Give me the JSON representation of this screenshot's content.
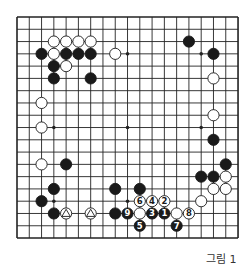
{
  "board": {
    "size": 19,
    "star_points": [
      [
        3,
        3
      ],
      [
        3,
        9
      ],
      [
        3,
        15
      ],
      [
        9,
        3
      ],
      [
        9,
        9
      ],
      [
        9,
        15
      ],
      [
        15,
        3
      ],
      [
        15,
        9
      ],
      [
        15,
        15
      ]
    ],
    "stones": [
      {
        "color": "white",
        "col": 3,
        "row": 2
      },
      {
        "color": "white",
        "col": 4,
        "row": 2
      },
      {
        "color": "white",
        "col": 5,
        "row": 2
      },
      {
        "color": "white",
        "col": 6,
        "row": 2
      },
      {
        "color": "black",
        "col": 2,
        "row": 3
      },
      {
        "color": "white",
        "col": 3,
        "row": 3
      },
      {
        "color": "black",
        "col": 4,
        "row": 3
      },
      {
        "color": "black",
        "col": 5,
        "row": 3
      },
      {
        "color": "black",
        "col": 6,
        "row": 3
      },
      {
        "color": "white",
        "col": 8,
        "row": 3
      },
      {
        "color": "black",
        "col": 3,
        "row": 4
      },
      {
        "color": "white",
        "col": 4,
        "row": 4
      },
      {
        "color": "black",
        "col": 3,
        "row": 5
      },
      {
        "color": "black",
        "col": 6,
        "row": 5
      },
      {
        "color": "white",
        "col": 2,
        "row": 7
      },
      {
        "color": "white",
        "col": 2,
        "row": 9
      },
      {
        "color": "white",
        "col": 2,
        "row": 12
      },
      {
        "color": "black",
        "col": 4,
        "row": 12
      },
      {
        "color": "black",
        "col": 3,
        "row": 14
      },
      {
        "color": "black",
        "col": 2,
        "row": 15
      },
      {
        "color": "black",
        "col": 3,
        "row": 16
      },
      {
        "color": "white",
        "col": 4,
        "row": 16,
        "mark": "triangle"
      },
      {
        "color": "white",
        "col": 6,
        "row": 16,
        "mark": "triangle"
      },
      {
        "color": "black",
        "col": 8,
        "row": 14
      },
      {
        "color": "black",
        "col": 10,
        "row": 14
      },
      {
        "color": "black",
        "col": 8,
        "row": 16
      },
      {
        "color": "black",
        "col": 9,
        "row": 16,
        "label": "9"
      },
      {
        "color": "white",
        "col": 10,
        "row": 16
      },
      {
        "color": "black",
        "col": 11,
        "row": 16,
        "label": "3"
      },
      {
        "color": "black",
        "col": 12,
        "row": 16,
        "label": "1"
      },
      {
        "color": "white",
        "col": 13,
        "row": 16
      },
      {
        "color": "white",
        "col": 14,
        "row": 16,
        "label": "8"
      },
      {
        "color": "white",
        "col": 10,
        "row": 15,
        "label": "6"
      },
      {
        "color": "white",
        "col": 11,
        "row": 15,
        "label": "4"
      },
      {
        "color": "white",
        "col": 12,
        "row": 15,
        "label": "2"
      },
      {
        "color": "black",
        "col": 10,
        "row": 17,
        "label": "5"
      },
      {
        "color": "black",
        "col": 13,
        "row": 17,
        "label": "7"
      },
      {
        "color": "black",
        "col": 14,
        "row": 2
      },
      {
        "color": "black",
        "col": 16,
        "row": 3
      },
      {
        "color": "white",
        "col": 16,
        "row": 5
      },
      {
        "color": "white",
        "col": 16,
        "row": 8
      },
      {
        "color": "black",
        "col": 16,
        "row": 10
      },
      {
        "color": "black",
        "col": 17,
        "row": 12
      },
      {
        "color": "black",
        "col": 15,
        "row": 13
      },
      {
        "color": "black",
        "col": 16,
        "row": 13
      },
      {
        "color": "white",
        "col": 17,
        "row": 13
      },
      {
        "color": "white",
        "col": 16,
        "row": 14
      },
      {
        "color": "white",
        "col": 17,
        "row": 14
      },
      {
        "color": "white",
        "col": 15,
        "row": 15
      }
    ]
  },
  "caption": "그림 1"
}
